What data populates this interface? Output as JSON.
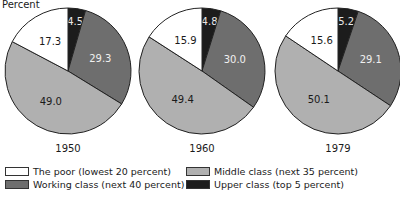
{
  "chart_data": {
    "type": "pie",
    "ylabel": "Percent",
    "series_names": [
      "The poor (lowest 20 percent)",
      "Working class (next 40 percent)",
      "Middle class (next 35 percent)",
      "Upper class (top 5 percent)"
    ],
    "pies": [
      {
        "year": "1950",
        "values": {
          "upper": 4.5,
          "working": 29.3,
          "middle": 49.0,
          "poor": 17.3
        }
      },
      {
        "year": "1960",
        "values": {
          "upper": 4.8,
          "working": 30.0,
          "middle": 49.4,
          "poor": 15.9
        }
      },
      {
        "year": "1979",
        "values": {
          "upper": 5.2,
          "working": 29.1,
          "middle": 50.1,
          "poor": 15.6
        }
      }
    ],
    "slice_order_clockwise_from_top": [
      "upper",
      "working",
      "middle",
      "poor"
    ],
    "colors": {
      "upper": "#1c1c1c",
      "working": "#6e6e6e",
      "middle": "#b0b0b0",
      "poor": "#ffffff"
    },
    "label_colors": {
      "upper": "#e8e8e8",
      "working": "#f0f0f0",
      "middle": "#1a1a1a",
      "poor": "#1a1a1a"
    },
    "legend_position": "bottom"
  },
  "legend": {
    "poor": "The poor (lowest 20 percent)",
    "working": "Working class (next 40 percent)",
    "middle": "Middle class (next 35 percent)",
    "upper": "Upper class (top 5 percent)"
  },
  "ylabel": "Percent"
}
